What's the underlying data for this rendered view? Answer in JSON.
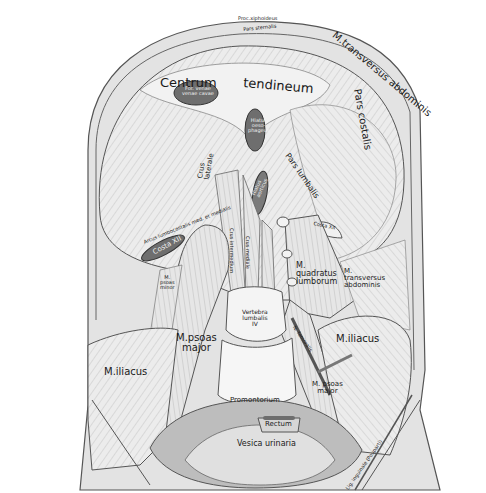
{
  "figure": {
    "colors": {
      "background": "#ffffff",
      "muscle_fill": "#e9e9e9",
      "muscle_shade": "#cfcfcf",
      "dark_opening": "#6e6e6e",
      "outline": "#4a4a4a",
      "text": "#1a1a1a"
    }
  },
  "labels": {
    "processus_xiphoideus": "Proc.xiphoideus",
    "pars_sternalis": "Pars sternalis",
    "m_transversus_abdominis_top": "M.transversus abdominis",
    "centrum": "Centrum",
    "tendineum": "tendineum",
    "foramen_venae_cavae": [
      "For. venae",
      "venae cavae"
    ],
    "hiatus_oesophageus": [
      "Hiatus",
      "oeso-",
      "phageus"
    ],
    "pars_costalis": "Pars costalis",
    "pars_lumbalis": "Pars lumbalis",
    "crus_laterale": [
      "Crus",
      "laterale"
    ],
    "hiatus_aorticus": [
      "Hiatus",
      "aorticus"
    ],
    "arcus_lumbocostalis_lateralis": "Arcus lumbocostalis lat.",
    "arcus_lumbocostalis_medialis": "Arcus lumbocostalis med. et medialis",
    "costa_xii_left": "Costa XII",
    "costa_xii_right": "Costa XII",
    "crus_intermedium": "Crus intermedium",
    "crus_mediale": "Crus mediale",
    "m_psoas_minor": [
      "M.",
      "psoas",
      "minor"
    ],
    "m_quadratus_lumborum": [
      "M.",
      "quadratus",
      "lumborum"
    ],
    "m_transversus_abdominis_right": [
      "M.",
      "transversus",
      "abdominis"
    ],
    "vertebra_lumbalis_iv": [
      "Vertebra",
      "lumbalis",
      "IV"
    ],
    "m_psoas_major_left": [
      "M.psoas",
      "major"
    ],
    "m_psoas_major_right": [
      "M. psoas",
      "major"
    ],
    "m_iliacus_left": "M.iliacus",
    "m_iliacus_right": "M.iliacus",
    "n_femoralis": "N. femoralis",
    "promontorium": "Promontorium",
    "rectum": "Rectum",
    "vesica_urinaria": "Vesica urinaria",
    "lig_inguinale": "Lig. inguinale (Pouparti)"
  }
}
